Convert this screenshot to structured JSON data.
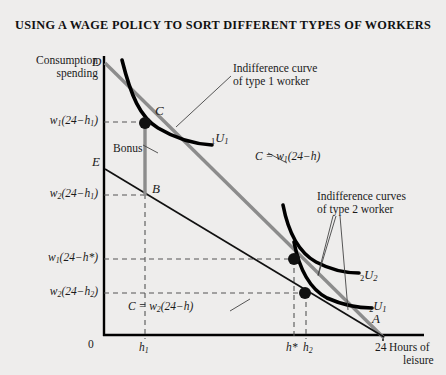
{
  "title": "USING A WAGE POLICY TO SORT DIFFERENT TYPES OF WORKERS",
  "axes": {
    "y_caption_line1": "Consumption",
    "y_caption_line2": "spending",
    "x_caption_line1": "Hours of",
    "x_caption_line2": "leisure",
    "origin": "0"
  },
  "y_ticks": [
    {
      "id": "w1_24_h1",
      "html": "w<sub>1</sub>(24−h<sub>1</sub>)",
      "y": 122
    },
    {
      "id": "w2_24_h1",
      "html": "w<sub>2</sub>(24−h<sub>1</sub>)",
      "y": 195
    },
    {
      "id": "w1_24_hstar",
      "html": "w<sub>1</sub>(24−h*)",
      "y": 259
    },
    {
      "id": "w2_24_h2",
      "html": "w<sub>2</sub>(24−h<sub>2</sub>)",
      "y": 293
    }
  ],
  "x_ticks": [
    {
      "id": "h1",
      "html": "h<sub>1</sub>",
      "x": 145
    },
    {
      "id": "hstar",
      "html": "h*",
      "x": 294
    },
    {
      "id": "h2",
      "html": "h<sub>2</sub>",
      "x": 307
    },
    {
      "id": "t24",
      "html": "24",
      "x": 383
    }
  ],
  "points": [
    {
      "id": "A",
      "label": "A",
      "x": 383,
      "y": 335,
      "dot": false
    },
    {
      "id": "B",
      "label": "B",
      "x": 145,
      "y": 195,
      "dot": false
    },
    {
      "id": "C",
      "label": "C",
      "x": 145,
      "y": 122,
      "dot": true
    },
    {
      "id": "D",
      "label": "D",
      "x": 104,
      "y": 64,
      "dot": false
    },
    {
      "id": "E",
      "label": "E",
      "x": 104,
      "y": 163,
      "dot": false
    },
    {
      "id": "tangency_U2",
      "label": "",
      "x": 294,
      "y": 259,
      "dot": true
    },
    {
      "id": "tangency_U1",
      "label": "",
      "x": 305,
      "y": 293,
      "dot": true
    }
  ],
  "annotations": {
    "bonus": "Bonus",
    "indiff_type1_line1": "Indifference curve",
    "indiff_type1_line2": "of type 1 worker",
    "indiff_type2_line1": "Indifference curves",
    "indiff_type2_line2": "of type 2 worker",
    "budget_high_html": "C = w<sub>1</sub>(24−h)",
    "budget_low_html": "C = w<sub>2</sub>(24−h)",
    "curve_1U1_html": "<span class=\"pre\">1</span>U<sub>1</sub>",
    "curve_2U2_html": "<span class=\"pre\">2</span>U<sub>2</sub>",
    "curve_2U1_html": "<span class=\"pre\">2</span>U<sub>1</sub>"
  },
  "colors": {
    "background": "#eeedec",
    "axis": "#000000",
    "curve": "#000000",
    "budget_gray": "#8c8c8c",
    "dash": "#555555",
    "leader": "#444444"
  },
  "chart_data": {
    "type": "line",
    "title": "USING A WAGE POLICY TO SORT DIFFERENT TYPES OF WORKERS",
    "xlabel": "Hours of leisure",
    "ylabel": "Consumption spending",
    "xlim": [
      0,
      26
    ],
    "ylim": [
      0,
      1
    ],
    "grid": false,
    "legend": "annotations",
    "series": [
      {
        "name": "C = w1(24-h)",
        "style": "gray-thick-line",
        "points": [
          [
            0,
            0.965
          ],
          [
            24,
            0.0
          ]
        ],
        "endpoint_labels": [
          "D",
          "A"
        ]
      },
      {
        "name": "C = w2(24-h)",
        "style": "black-thin-line",
        "points": [
          [
            0,
            0.62
          ],
          [
            24,
            0.0
          ]
        ],
        "endpoint_labels": [
          "E",
          "A"
        ]
      },
      {
        "name": "1U1",
        "style": "black-thick-convex-curve",
        "points": [
          [
            2.6,
            1.0
          ],
          [
            4.0,
            0.86
          ],
          [
            5.2,
            0.79
          ],
          [
            7.2,
            0.74
          ],
          [
            9.0,
            0.72
          ]
        ],
        "tangency_point": "C"
      },
      {
        "name": "2U2",
        "style": "black-thick-convex-curve",
        "points": [
          [
            15.2,
            0.555
          ],
          [
            17.5,
            0.38
          ],
          [
            20.0,
            0.3
          ],
          [
            23.0,
            0.275
          ]
        ],
        "tangency_point": "(h*, w1(24-h*))"
      },
      {
        "name": "2U1",
        "style": "black-thick-convex-curve",
        "points": [
          [
            16.2,
            0.42
          ],
          [
            19.0,
            0.22
          ],
          [
            22.0,
            0.135
          ],
          [
            25.0,
            0.115
          ]
        ],
        "tangency_point": "(h2, w2(24-h2))"
      }
    ],
    "markers": [
      {
        "label": "C",
        "x": 4.3,
        "y": 0.83,
        "note": "tangency of 1U1 with gray budget line"
      },
      {
        "label": "B",
        "x": 4.3,
        "y": 0.515,
        "note": "bottom of bonus segment on black budget line"
      },
      {
        "label": "h*",
        "x": 18.9,
        "y": 0.355,
        "note": "tangency of 2U2 with gray budget line"
      },
      {
        "label": "h2",
        "x": 19.9,
        "y": 0.125,
        "note": "tangency of 2U1 with black budget line"
      }
    ],
    "annotations": [
      {
        "text": "Bonus",
        "refers_to": "vertical gray segment between B and C"
      },
      {
        "text": "Indifference curve of type 1 worker",
        "refers_to": "1U1"
      },
      {
        "text": "Indifference curves of type 2 worker",
        "refers_to": "2U2 and 2U1"
      }
    ]
  }
}
